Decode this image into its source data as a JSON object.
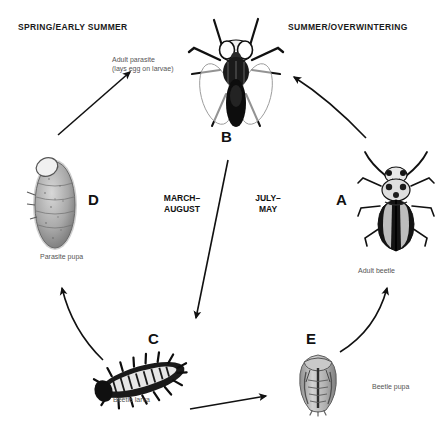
{
  "diagram": {
    "background_color": "#ffffff",
    "ink_color": "#111111",
    "caption_color": "#555555"
  },
  "headers": {
    "left": "SPRING/EARLY SUMMER",
    "right": "SUMMER/OVERWINTERING"
  },
  "periods": {
    "left": "MARCH–\nAUGUST",
    "right": "JULY–\nMAY"
  },
  "stages": {
    "a": {
      "letter": "A",
      "caption": "Adult beetle",
      "icon": "adult-beetle-icon"
    },
    "b": {
      "letter": "B",
      "caption": "Adult parasite\n(lays egg on larvae)",
      "icon": "adult-parasite-fly-icon"
    },
    "c": {
      "letter": "C",
      "caption": "Beetle larva",
      "icon": "beetle-larva-icon"
    },
    "d": {
      "letter": "D",
      "caption": "Parasite pupa",
      "icon": "parasite-pupa-icon"
    },
    "e": {
      "letter": "E",
      "caption": "Beetle pupa",
      "icon": "beetle-pupa-icon"
    }
  },
  "arrows": [
    {
      "name": "arrow-d-to-parasite",
      "from": "parasite-pupa",
      "to": "adult-parasite",
      "style": "straight"
    },
    {
      "name": "arrow-a-to-parasite",
      "from": "adult-beetle",
      "to": "adult-parasite",
      "style": "curved"
    },
    {
      "name": "arrow-parasite-to-larva",
      "from": "adult-parasite",
      "to": "beetle-larva",
      "style": "straight-vertical"
    },
    {
      "name": "arrow-larva-to-parasite-pupa",
      "from": "beetle-larva",
      "to": "parasite-pupa",
      "style": "curved"
    },
    {
      "name": "arrow-larva-to-beetle-pupa",
      "from": "beetle-larva",
      "to": "beetle-pupa",
      "style": "curved-horizontal"
    },
    {
      "name": "arrow-beetle-pupa-to-adult-beetle",
      "from": "beetle-pupa",
      "to": "adult-beetle",
      "style": "curved"
    }
  ]
}
